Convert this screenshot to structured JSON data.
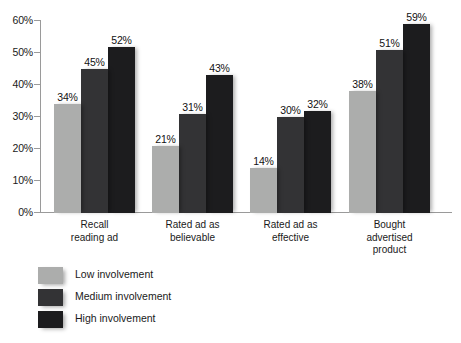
{
  "chart_data": {
    "type": "bar",
    "title": "",
    "xlabel": "",
    "ylabel": "",
    "ylim": [
      0,
      60
    ],
    "ytick_labels": [
      "0%",
      "10%",
      "20%",
      "30%",
      "40%",
      "50%",
      "60%"
    ],
    "ytick_values": [
      0,
      10,
      20,
      30,
      40,
      50,
      60
    ],
    "grid": false,
    "legend_position": "bottom-left",
    "categories": [
      "Recall\nreading ad",
      "Rated ad as\nbelievable",
      "Rated ad as\neffective",
      "Bought\nadvertised\nproduct"
    ],
    "category_lines": [
      [
        "Recall",
        "reading ad"
      ],
      [
        "Rated ad as",
        "believable"
      ],
      [
        "Rated ad as",
        "effective"
      ],
      [
        "Bought",
        "advertised",
        "product"
      ]
    ],
    "series": [
      {
        "name": "Low involvement",
        "color": "#acadac",
        "values": [
          34,
          21,
          14,
          38
        ],
        "labels": [
          "34%",
          "21%",
          "14%",
          "38%"
        ]
      },
      {
        "name": "Medium involvement",
        "color": "#333335",
        "values": [
          45,
          31,
          30,
          51
        ],
        "labels": [
          "45%",
          "31%",
          "30%",
          "51%"
        ]
      },
      {
        "name": "High involvement",
        "color": "#1c1c1e",
        "values": [
          52,
          43,
          32,
          59
        ],
        "labels": [
          "52%",
          "43%",
          "32%",
          "59%"
        ]
      }
    ]
  },
  "axis": {
    "ticks": [
      {
        "label": "60%",
        "value": 60
      },
      {
        "label": "50%",
        "value": 50
      },
      {
        "label": "40%",
        "value": 40
      },
      {
        "label": "30%",
        "value": 30
      },
      {
        "label": "20%",
        "value": 20
      },
      {
        "label": "10%",
        "value": 10
      },
      {
        "label": "0%",
        "value": 0
      }
    ]
  },
  "legend": {
    "items": [
      {
        "label": "Low involvement",
        "swatch": "low"
      },
      {
        "label": "Medium involvement",
        "swatch": "med"
      },
      {
        "label": "High involvement",
        "swatch": "high"
      }
    ]
  }
}
